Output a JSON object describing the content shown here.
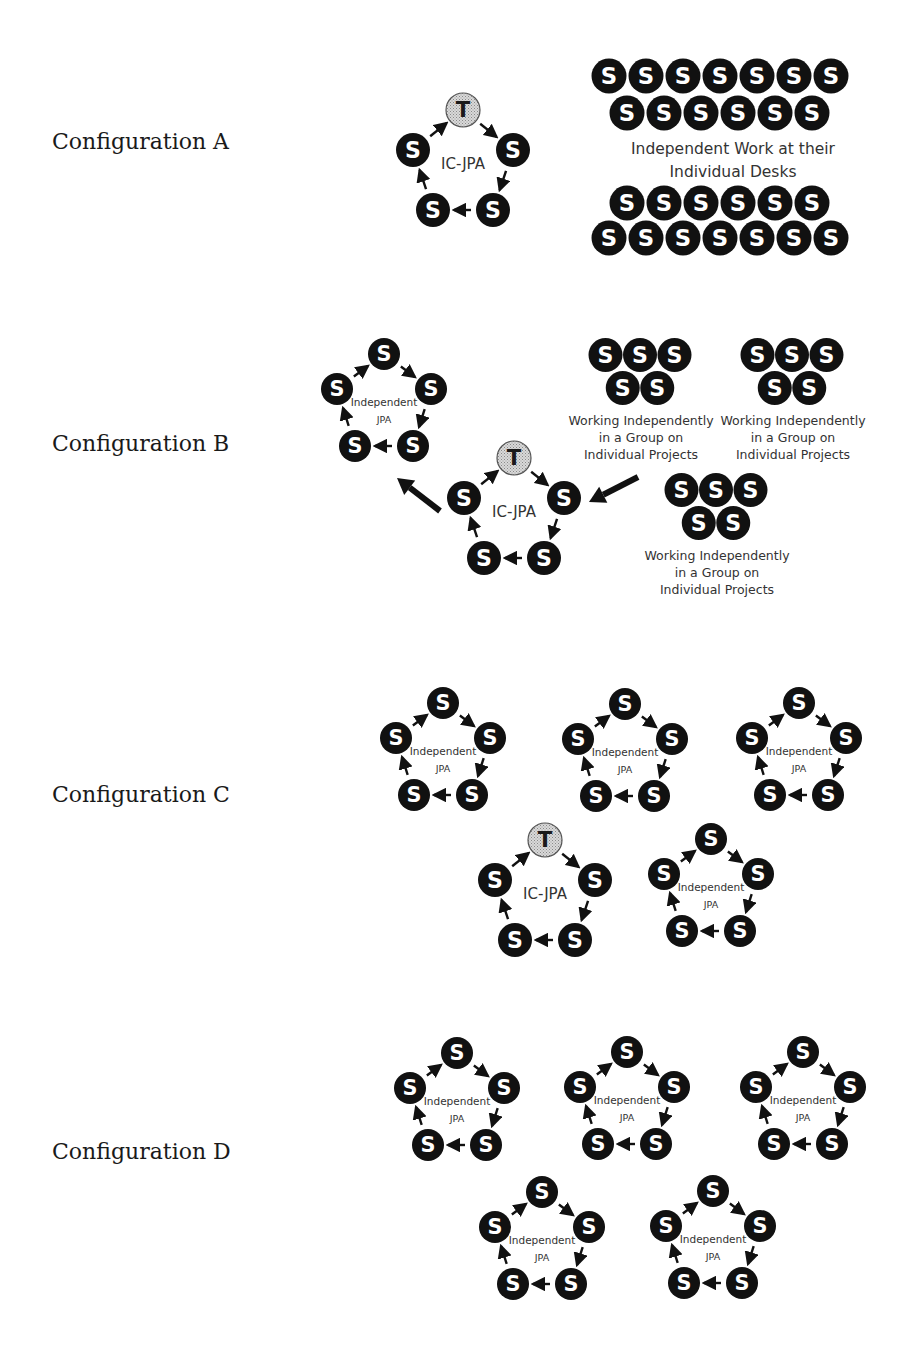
{
  "colors": {
    "student_fill": "#111111",
    "teacher_fill": "#c8c8c8",
    "text": "#333333",
    "arrow": "#111111"
  },
  "glyphs": {
    "student": "S",
    "teacher": "T"
  },
  "configurations": [
    {
      "label": "Configuration A",
      "label_y": 143,
      "ic_jpa": [
        {
          "cx": 463,
          "cy": 165,
          "label": "IC-JPA",
          "teacher": true
        }
      ],
      "independent_jpa": [],
      "desks": {
        "rows": [
          {
            "y": 76,
            "x0": 609,
            "count": 7
          },
          {
            "y": 113,
            "x0": 627,
            "count": 6
          },
          {
            "y": 203,
            "x0": 627,
            "count": 6
          },
          {
            "y": 238,
            "x0": 609,
            "count": 7
          }
        ],
        "step": 37,
        "label_lines": [
          "Independent Work at their",
          "Individual Desks"
        ],
        "label_x": 733,
        "label_y": [
          149,
          172
        ]
      },
      "groups": [],
      "big_arrows": []
    },
    {
      "label": "Configuration B",
      "label_y": 445,
      "ic_jpa": [
        {
          "cx": 514,
          "cy": 513,
          "label": "IC-JPA",
          "teacher": true
        }
      ],
      "independent_jpa": [
        {
          "cx": 384,
          "cy": 405,
          "line1": "Independent",
          "line2": "JPA"
        }
      ],
      "groups": [
        {
          "x": 640,
          "y": 355,
          "lines": [
            "Working Independently",
            "in a Group on",
            "Individual Projects"
          ]
        },
        {
          "x": 792,
          "y": 355,
          "lines": [
            "Working Independently",
            "in a Group on",
            "Individual Projects"
          ]
        },
        {
          "x": 716,
          "y": 490,
          "lines": [
            "Working Independently",
            "in a Group on",
            "Individual Projects"
          ]
        }
      ],
      "big_arrows": [
        {
          "x1": 440,
          "y1": 511,
          "x2": 397,
          "y2": 478
        },
        {
          "x1": 638,
          "y1": 477,
          "x2": 589,
          "y2": 502
        }
      ]
    },
    {
      "label": "Configuration C",
      "label_y": 796,
      "ic_jpa": [
        {
          "cx": 545,
          "cy": 895,
          "label": "IC-JPA",
          "teacher": true
        }
      ],
      "independent_jpa": [
        {
          "cx": 443,
          "cy": 754,
          "line1": "Independent",
          "line2": "JPA"
        },
        {
          "cx": 625,
          "cy": 755,
          "line1": "Independent",
          "line2": "JPA"
        },
        {
          "cx": 799,
          "cy": 754,
          "line1": "Independent",
          "line2": "JPA"
        },
        {
          "cx": 711,
          "cy": 890,
          "line1": "Independent",
          "line2": "JPA"
        }
      ],
      "groups": [],
      "big_arrows": []
    },
    {
      "label": "Configuration D",
      "label_y": 1153,
      "ic_jpa": [],
      "independent_jpa": [
        {
          "cx": 457,
          "cy": 1104,
          "line1": "Independent",
          "line2": "JPA"
        },
        {
          "cx": 627,
          "cy": 1103,
          "line1": "Independent",
          "line2": "JPA"
        },
        {
          "cx": 803,
          "cy": 1103,
          "line1": "Independent",
          "line2": "JPA"
        },
        {
          "cx": 542,
          "cy": 1243,
          "line1": "Independent",
          "line2": "JPA"
        },
        {
          "cx": 713,
          "cy": 1242,
          "line1": "Independent",
          "line2": "JPA"
        }
      ],
      "groups": [],
      "big_arrows": []
    }
  ]
}
